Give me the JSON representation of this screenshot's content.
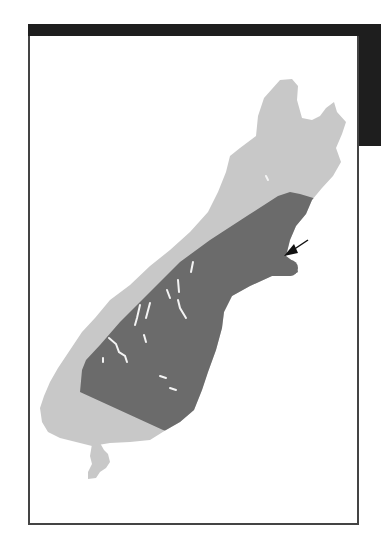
{
  "figure": {
    "colors": {
      "band": "#1e1e1e",
      "land": "#c8c8c8",
      "highlight_region": "#6b6b6b",
      "lakes": "#ffffff",
      "arrow": "#111111",
      "frame_border": "#444444"
    },
    "arrow": {
      "points_to": "Banks Peninsula",
      "from": [
        308,
        240
      ],
      "to": [
        286,
        255
      ]
    }
  }
}
